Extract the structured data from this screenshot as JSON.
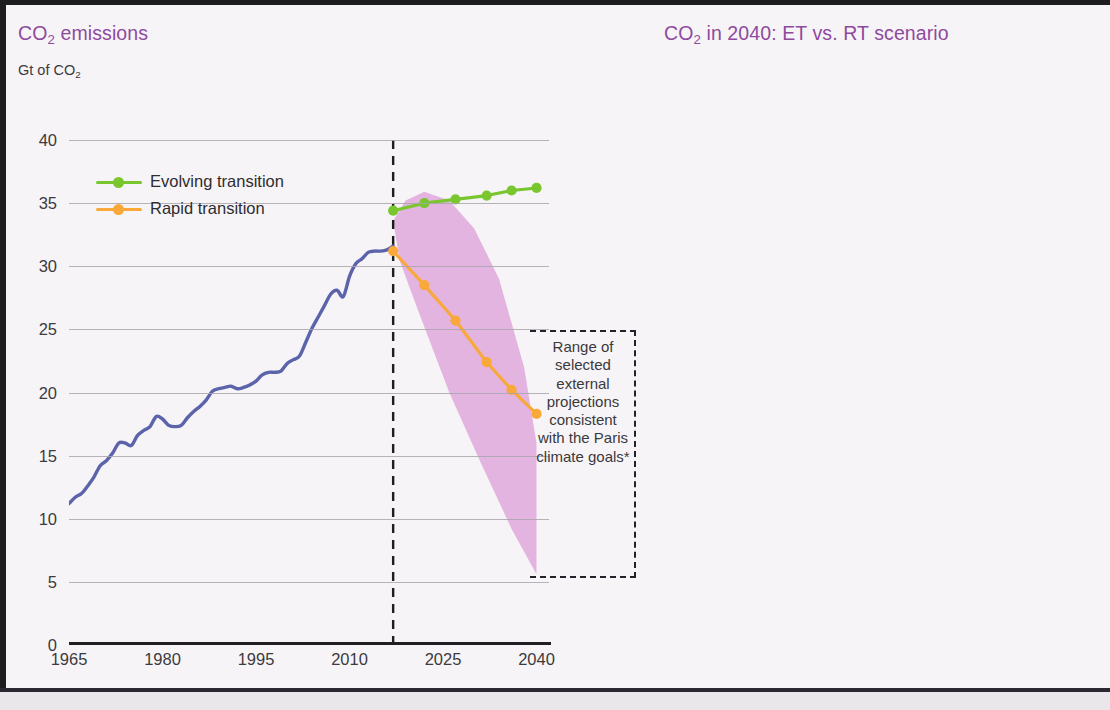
{
  "figure": {
    "background": "#f7f4f7",
    "title_color": "#8e4a9e"
  },
  "left_panel": {
    "title_main": "CO",
    "title_sub": "2",
    "title_tail": " emissions",
    "axis_unit_main": "Gt of CO",
    "axis_unit_sub": "2",
    "legend": [
      {
        "label": "Evolving transition",
        "color": "#79c62f"
      },
      {
        "label": "Rapid transition",
        "color": "#f9a83a"
      }
    ],
    "annotation": "Range of selected external projections consistent with the Paris climate goals*",
    "history_color": "#5b63ab",
    "band_color": "#e2aede",
    "divider_year": 2017
  },
  "right_panel": {
    "title_main": "CO",
    "title_sub": "2",
    "title_tail": " in 2040: ET vs. RT scenario"
  },
  "chart_data": [
    {
      "type": "line",
      "id": "co2-emissions-history-and-projections",
      "title": "CO2 emissions",
      "ylabel": "Gt of CO2",
      "xlabel": "",
      "xlim": [
        1965,
        2042
      ],
      "ylim": [
        0,
        40
      ],
      "yticks": [
        0,
        5,
        10,
        15,
        20,
        25,
        30,
        35,
        40
      ],
      "xticks": [
        1965,
        1980,
        1995,
        2010,
        2025,
        2040
      ],
      "grid": true,
      "legend_position": "top-left",
      "annotations": [
        {
          "text": "Range of selected external projections consistent with the Paris climate goals*",
          "x": 2033,
          "y": 22
        }
      ],
      "vertical_divider_x": 2017,
      "series": [
        {
          "name": "History",
          "color": "#5b63ab",
          "x": [
            1965,
            1966,
            1967,
            1968,
            1969,
            1970,
            1971,
            1972,
            1973,
            1974,
            1975,
            1976,
            1977,
            1978,
            1979,
            1980,
            1981,
            1982,
            1983,
            1984,
            1985,
            1986,
            1987,
            1988,
            1989,
            1990,
            1991,
            1992,
            1993,
            1994,
            1995,
            1996,
            1997,
            1998,
            1999,
            2000,
            2001,
            2002,
            2003,
            2004,
            2005,
            2006,
            2007,
            2008,
            2009,
            2010,
            2011,
            2012,
            2013,
            2014,
            2015,
            2016,
            2017
          ],
          "values": [
            11.2,
            11.7,
            12.0,
            12.6,
            13.3,
            14.2,
            14.6,
            15.2,
            16.0,
            16.0,
            15.8,
            16.6,
            17.0,
            17.3,
            18.1,
            17.9,
            17.4,
            17.3,
            17.4,
            18.0,
            18.5,
            18.9,
            19.4,
            20.1,
            20.3,
            20.4,
            20.5,
            20.3,
            20.4,
            20.6,
            20.9,
            21.4,
            21.6,
            21.6,
            21.7,
            22.3,
            22.6,
            22.9,
            24.0,
            25.1,
            26.0,
            26.9,
            27.8,
            28.1,
            27.6,
            29.2,
            30.2,
            30.6,
            31.1,
            31.2,
            31.2,
            31.3,
            31.6
          ]
        },
        {
          "name": "Evolving transition",
          "color": "#79c62f",
          "marker": "circle",
          "x": [
            2017,
            2022,
            2027,
            2032,
            2036,
            2040
          ],
          "values": [
            34.4,
            35.0,
            35.3,
            35.6,
            36.0,
            36.2
          ]
        },
        {
          "name": "Rapid transition",
          "color": "#f9a83a",
          "marker": "circle",
          "x": [
            2017,
            2022,
            2027,
            2032,
            2036,
            2040
          ],
          "values": [
            31.2,
            28.5,
            25.7,
            22.4,
            20.2,
            18.3
          ]
        }
      ],
      "band": {
        "name": "Range of selected external projections consistent with the Paris climate goals",
        "color": "#e2aede",
        "x": [
          2017,
          2019,
          2022,
          2026,
          2030,
          2034,
          2038,
          2040,
          2040,
          2036,
          2031,
          2026,
          2021,
          2018,
          2017
        ],
        "upper": [
          33.6,
          35.2,
          35.9,
          35.2,
          33.0,
          29.0,
          22.0,
          16.0,
          5.6,
          9.2,
          14.5,
          20.0,
          26.5,
          30.5,
          33.6
        ]
      }
    },
    {
      "type": "bar",
      "id": "co2-2040-et-vs-rt-waterfall",
      "title": "CO2 in 2040: ET vs. RT scenario",
      "xlabel": "",
      "ylabel": "",
      "ylim": [
        0,
        40
      ],
      "yticks": [
        0,
        5,
        10,
        15,
        20,
        25,
        30,
        35,
        40
      ],
      "grid": true,
      "categories": [
        "ET 2040",
        "Power",
        "Industry\n& Buildings",
        "Transport",
        "RT 2040"
      ],
      "bars": [
        {
          "label": "ET 2040",
          "base": 0.0,
          "top": 36.2,
          "value": 36.2,
          "color": "#7dcc3c"
        },
        {
          "label": "Power",
          "base": 25.0,
          "top": 36.2,
          "value": -11.2,
          "color": "#8b3e95"
        },
        {
          "label": "Industry & Buildings",
          "base": 20.2,
          "top": 25.2,
          "value": -5.0,
          "color": "#fa6e2e"
        },
        {
          "label": "Transport",
          "base": 19.3,
          "top": 20.1,
          "value": -0.8,
          "color": "#4dafea"
        },
        {
          "label": "RT 2040",
          "base": 0.0,
          "top": 19.3,
          "value": 19.3,
          "color": "#f9b044"
        }
      ]
    }
  ]
}
